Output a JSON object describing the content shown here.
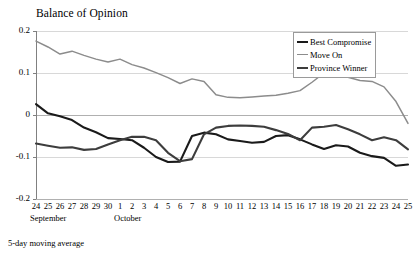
{
  "figure": {
    "title": "Balance of Opinion",
    "footnote": "5-day moving average"
  },
  "legend": {
    "position": "top-right",
    "entries": [
      {
        "label": "Best Compromise",
        "color": "#1a1a1a"
      },
      {
        "label": "Move On",
        "color": "#8c8c8c"
      },
      {
        "label": "Province Winner",
        "color": "#3d3d3d"
      }
    ]
  },
  "axes": {
    "y_ticks": [
      "0.2",
      "0.1",
      "0",
      "-0.1",
      "-0.2"
    ],
    "x_tick_labels": [
      "24",
      "25",
      "26",
      "27",
      "28",
      "29",
      "30",
      "1",
      "2",
      "3",
      "4",
      "5",
      "6",
      "7",
      "8",
      "9",
      "10",
      "11",
      "12",
      "13",
      "14",
      "15",
      "16",
      "17",
      "18",
      "19",
      "20",
      "21",
      "22",
      "23",
      "24",
      "25"
    ],
    "month_groups": [
      {
        "label": "September",
        "start_index": 0,
        "end_index": 6
      },
      {
        "label": "October",
        "start_index": 7,
        "end_index": 31
      }
    ]
  },
  "chart_data": {
    "type": "line",
    "title": "Balance of Opinion",
    "subtitle": "5-day moving average",
    "xlabel": "",
    "ylabel": "",
    "ylim": [
      -0.2,
      0.2
    ],
    "yticks": [
      -0.2,
      -0.1,
      0,
      0.1,
      0.2
    ],
    "grid": "horizontal",
    "legend_position": "top-right",
    "x": [
      "Sep 24",
      "Sep 25",
      "Sep 26",
      "Sep 27",
      "Sep 28",
      "Sep 29",
      "Sep 30",
      "Oct 1",
      "Oct 2",
      "Oct 3",
      "Oct 4",
      "Oct 5",
      "Oct 6",
      "Oct 7",
      "Oct 8",
      "Oct 9",
      "Oct 10",
      "Oct 11",
      "Oct 12",
      "Oct 13",
      "Oct 14",
      "Oct 15",
      "Oct 16",
      "Oct 17",
      "Oct 18",
      "Oct 19",
      "Oct 20",
      "Oct 21",
      "Oct 22",
      "Oct 23",
      "Oct 24",
      "Oct 25"
    ],
    "x_tick_labels": [
      "24",
      "25",
      "26",
      "27",
      "28",
      "29",
      "30",
      "1",
      "2",
      "3",
      "4",
      "5",
      "6",
      "7",
      "8",
      "9",
      "10",
      "11",
      "12",
      "13",
      "14",
      "15",
      "16",
      "17",
      "18",
      "19",
      "20",
      "21",
      "22",
      "23",
      "24",
      "25"
    ],
    "series": [
      {
        "name": "Move On",
        "color": "#8c8c8c",
        "values": [
          0.176,
          0.162,
          0.145,
          0.152,
          0.142,
          0.133,
          0.126,
          0.133,
          0.12,
          0.112,
          0.101,
          0.089,
          0.075,
          0.086,
          0.08,
          0.048,
          0.042,
          0.041,
          0.043,
          0.045,
          0.047,
          0.052,
          0.058,
          0.078,
          0.1,
          0.134,
          0.09,
          0.082,
          0.08,
          0.067,
          0.032,
          -0.02
        ]
      },
      {
        "name": "Best Compromise",
        "color": "#1a1a1a",
        "values": [
          0.026,
          0.004,
          -0.003,
          -0.012,
          -0.03,
          -0.041,
          -0.055,
          -0.057,
          -0.06,
          -0.078,
          -0.1,
          -0.112,
          -0.111,
          -0.05,
          -0.042,
          -0.046,
          -0.058,
          -0.062,
          -0.066,
          -0.064,
          -0.05,
          -0.048,
          -0.058,
          -0.07,
          -0.081,
          -0.072,
          -0.075,
          -0.09,
          -0.098,
          -0.102,
          -0.121,
          -0.118
        ]
      },
      {
        "name": "Province Winner",
        "color": "#3d3d3d",
        "values": [
          -0.068,
          -0.073,
          -0.078,
          -0.077,
          -0.083,
          -0.081,
          -0.07,
          -0.06,
          -0.052,
          -0.052,
          -0.06,
          -0.09,
          -0.11,
          -0.105,
          -0.046,
          -0.03,
          -0.026,
          -0.025,
          -0.026,
          -0.028,
          -0.036,
          -0.045,
          -0.06,
          -0.03,
          -0.028,
          -0.024,
          -0.034,
          -0.046,
          -0.06,
          -0.053,
          -0.06,
          -0.082
        ]
      }
    ]
  }
}
